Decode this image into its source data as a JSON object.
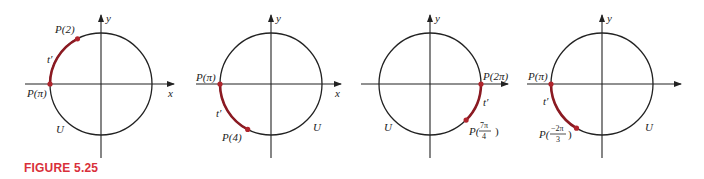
{
  "figure": {
    "caption": "FIGURE 5.25",
    "caption_color": "#d9303a",
    "arc_color": "#8b1a22",
    "axis_labels": {
      "x": "x",
      "y": "y"
    },
    "panels": [
      {
        "id": "panel-1",
        "start_angle": "π",
        "end_angle": "2",
        "show_x_label": true,
        "labels": {
          "start_point": "P(π)",
          "end_point": "P(2)",
          "arc": "t′",
          "circle": "U"
        }
      },
      {
        "id": "panel-2",
        "start_angle": "π",
        "end_angle": "4",
        "show_x_label": true,
        "labels": {
          "start_point": "P(π)",
          "end_point": "P(4)",
          "arc": "t′",
          "circle": "U"
        }
      },
      {
        "id": "panel-3",
        "start_angle": "2π",
        "end_angle": "7π/4",
        "show_x_label": false,
        "labels": {
          "start_point": "P(2π)",
          "end_point_prefix": "P(",
          "end_point_num": "7π",
          "end_point_den": "4",
          "end_point_suffix": ")",
          "arc": "t′",
          "circle": "U"
        }
      },
      {
        "id": "panel-4",
        "start_angle": "π",
        "end_angle": "−2π/3",
        "show_x_label": false,
        "labels": {
          "start_point": "P(π)",
          "end_point_prefix": "P(",
          "end_point_num": "−2π",
          "end_point_den": "3",
          "end_point_suffix": ")",
          "arc": "t′",
          "circle": "U"
        }
      }
    ]
  }
}
